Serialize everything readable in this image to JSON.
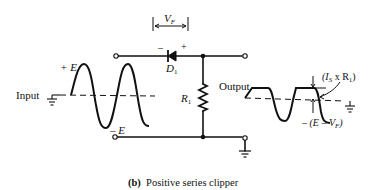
{
  "figure": {
    "caption_tag": "(b)",
    "caption_text": "Positive series clipper"
  },
  "labels": {
    "input": "Input",
    "output": "Output",
    "plus_e": "+ E",
    "minus_e": "– E",
    "vf_main": "V",
    "vf_sub": "F",
    "diode_main": "D",
    "diode_sub": "1",
    "diode_minus": "–",
    "diode_plus": "+",
    "resistor_main": "R",
    "resistor_sub": "1",
    "is_r1_open": "(I",
    "is_r1_sub": "S",
    "is_r1_mid": " x R",
    "is_r1_sub2": "1",
    "is_r1_close": ")",
    "e_minus_vf_prefix": "– (E – V",
    "e_minus_vf_sub": "F",
    "e_minus_vf_close": ")"
  },
  "components": [
    {
      "type": "diode",
      "name": "D1",
      "orientation": "cathode-left"
    },
    {
      "type": "resistor",
      "name": "R1",
      "orientation": "vertical-shunt"
    }
  ],
  "colors": {
    "ink": "#111111",
    "background": "#ffffff"
  }
}
